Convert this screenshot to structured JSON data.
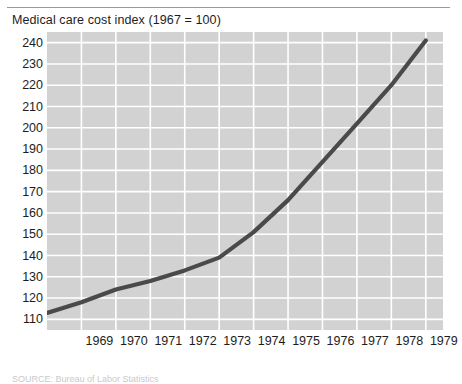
{
  "figure": {
    "title": "Medical care cost index (1967 = 100)",
    "source_note": "SOURCE: Bureau of Labor Statistics",
    "plot_bg_color": "#d2d2d2",
    "grid_color": "#ffffff",
    "line_color": "#4a4a4a",
    "rule_color": "#9a9a9a"
  },
  "chart_data": {
    "type": "line",
    "title": "Medical care cost index (1967 = 100)",
    "xlabel": "",
    "ylabel": "",
    "x": [
      1968,
      1969,
      1970,
      1971,
      1972,
      1973,
      1974,
      1975,
      1976,
      1977,
      1978,
      1979
    ],
    "values": [
      113,
      118,
      124,
      128,
      133,
      139,
      151,
      166,
      184,
      202,
      220,
      241
    ],
    "xlim": [
      1968,
      1979.5
    ],
    "ylim": [
      105,
      245
    ],
    "ytick_labels": [
      "240",
      "230",
      "220",
      "210",
      "200",
      "190",
      "180",
      "170",
      "160",
      "150",
      "140",
      "130",
      "120",
      "110"
    ],
    "yticks": [
      240,
      230,
      220,
      210,
      200,
      190,
      180,
      170,
      160,
      150,
      140,
      130,
      120,
      110
    ],
    "xtick_labels": [
      "1969",
      "1970",
      "1971",
      "1972",
      "1973",
      "1974",
      "1975",
      "1976",
      "1977",
      "1978",
      "1979"
    ],
    "xticks": [
      1969,
      1970,
      1971,
      1972,
      1973,
      1974,
      1975,
      1976,
      1977,
      1978,
      1979
    ],
    "grid": true,
    "grid_axis": "both",
    "legend": false,
    "series": [
      {
        "name": "Medical care cost index",
        "values": [
          113,
          118,
          124,
          128,
          133,
          139,
          151,
          166,
          184,
          202,
          220,
          241
        ]
      }
    ]
  }
}
